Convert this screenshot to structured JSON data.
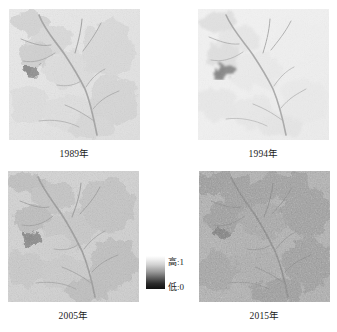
{
  "figure": {
    "type": "remote-sensing-image-grid"
  },
  "panels": [
    {
      "id": "1989",
      "caption": "1989年",
      "year": "1989",
      "position": "top-left",
      "tone": "light",
      "alt": "Grayscale vegetation index raster with branching dark river network and a dark reservoir patch on the left"
    },
    {
      "id": "1994",
      "caption": "1994年",
      "year": "1994",
      "position": "top-right",
      "tone": "lightest",
      "alt": "Grayscale vegetation index raster, overall brightest, with branching dark river network and dark reservoir patch"
    },
    {
      "id": "2005",
      "caption": "2005年",
      "year": "2005",
      "position": "bottom-left",
      "tone": "medium",
      "alt": "Grayscale vegetation index raster with higher contrast texture, branching river network and dark reservoir patch"
    },
    {
      "id": "2015",
      "caption": "2015年",
      "year": "2015",
      "position": "bottom-right",
      "tone": "darkest",
      "alt": "Grayscale vegetation index raster, overall darkest with dense texture, branching river network and dark reservoir patch"
    }
  ],
  "legend": {
    "name": "grayscale-value-ramp",
    "high_label": "高:1",
    "low_label": "低:0",
    "high_value": 1,
    "low_value": 0,
    "high_color": "#ffffff",
    "low_color": "#111111",
    "orientation": "vertical"
  },
  "colors": {
    "background": "#ffffff",
    "text": "#1c1c1c"
  }
}
